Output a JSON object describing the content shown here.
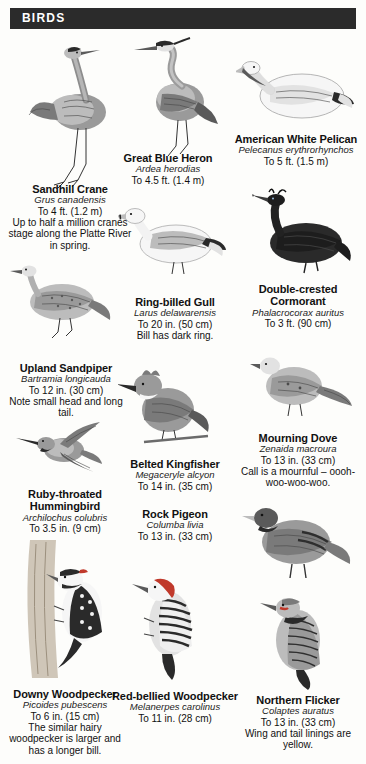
{
  "header": {
    "title": "BIRDS"
  },
  "species": [
    {
      "id": "sandhill-crane",
      "common": "Sandhill Crane",
      "scientific": "Grus canadensis",
      "size": "To 4 ft. (1.2 m)",
      "note": "Up to half a million cranes stage along the Platte River in spring."
    },
    {
      "id": "great-blue-heron",
      "common": "Great Blue Heron",
      "scientific": "Ardea herodias",
      "size": "To 4.5 ft. (1.4 m)",
      "note": ""
    },
    {
      "id": "american-white-pelican",
      "common": "American White Pelican",
      "scientific": "Pelecanus erythrorhynchos",
      "size": "To 5 ft. (1.5 m)",
      "note": ""
    },
    {
      "id": "ring-billed-gull",
      "common": "Ring-billed Gull",
      "scientific": "Larus delawarensis",
      "size": "To 20 in. (50 cm)",
      "note": "Bill has dark ring."
    },
    {
      "id": "double-crested-cormorant",
      "common": "Double-crested Cormorant",
      "scientific": "Phalacrocorax auritus",
      "size": "To 3 ft. (90 cm)",
      "note": ""
    },
    {
      "id": "upland-sandpiper",
      "common": "Upland Sandpiper",
      "scientific": "Bartramia longicauda",
      "size": "To 12 in. (30 cm)",
      "note": "Note small head and long tail."
    },
    {
      "id": "belted-kingfisher",
      "common": "Belted Kingfisher",
      "scientific": "Megaceryle alcyon",
      "size": "To 14 in. (35 cm)",
      "note": ""
    },
    {
      "id": "mourning-dove",
      "common": "Mourning Dove",
      "scientific": "Zenaida macroura",
      "size": "To 13 in. (33 cm)",
      "note": "Call is a mournful – oooh-woo-woo-woo."
    },
    {
      "id": "ruby-throated-hummingbird",
      "common": "Ruby-throated Hummingbird",
      "scientific": "Archilochus colubris",
      "size": "To 3.5 in. (9 cm)",
      "note": ""
    },
    {
      "id": "rock-pigeon",
      "common": "Rock Pigeon",
      "scientific": "Columba livia",
      "size": "To 13 in. (33 cm)",
      "note": ""
    },
    {
      "id": "downy-woodpecker",
      "common": "Downy Woodpecker",
      "scientific": "Picoides pubescens",
      "size": "To 6 in. (15 cm)",
      "note": "The similar hairy woodpecker is larger and has a longer bill."
    },
    {
      "id": "red-bellied-woodpecker",
      "common": "Red-bellied Woodpecker",
      "scientific": "Melanerpes carolinus",
      "size": "To 11 in. (28 cm)",
      "note": ""
    },
    {
      "id": "northern-flicker",
      "common": "Northern Flicker",
      "scientific": "Colaptes auratus",
      "size": "To 13 in. (33 cm)",
      "note": "Wing and tail linings are yellow."
    }
  ],
  "colors": {
    "header_bg": "#2b2b2b",
    "header_text": "#ffffff",
    "page_bg": "#fdfdfb",
    "body_text": "#111111"
  }
}
